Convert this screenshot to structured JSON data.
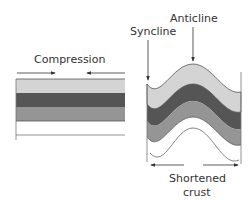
{
  "labels": {
    "compression": "Compression",
    "syncline": "Syncline",
    "anticline": "Anticline",
    "shortened_line1": "Shortened",
    "shortened_line2": "crust"
  },
  "colors": {
    "layer_light": "#d4d4d4",
    "layer_dark": "#555555",
    "layer_mid": "#959595",
    "layer_bottom": "#ffffff",
    "stroke": "#444444"
  }
}
